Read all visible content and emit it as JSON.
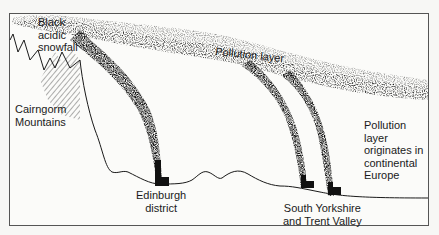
{
  "diagram": {
    "type": "illustrated cross-section",
    "colors": {
      "background": "#fbfbf9",
      "ink": "#1a1a1a",
      "frame": "#555555"
    },
    "labels": {
      "snowfall": [
        "Black",
        "acidic",
        "snowfall"
      ],
      "mountains": [
        "Cairngorm",
        "Mountains"
      ],
      "pollution_layer": "Pollution layer",
      "origin": [
        "Pollution",
        "layer",
        "originates in",
        "continental",
        "Europe"
      ],
      "edinburgh": [
        "Edinburgh",
        "district"
      ],
      "south_yorkshire": [
        "South Yorkshire",
        "and Trent Valley"
      ]
    },
    "elements": [
      {
        "name": "cairngorm-mountains",
        "kind": "terrain"
      },
      {
        "name": "snowfall-hatching",
        "kind": "hatched area"
      },
      {
        "name": "pollution-layer",
        "kind": "stippled band"
      },
      {
        "name": "edinburgh-chimney",
        "kind": "factory with plume"
      },
      {
        "name": "south-yorkshire-chimney-1",
        "kind": "factory with plume"
      },
      {
        "name": "south-yorkshire-chimney-2",
        "kind": "factory with plume"
      }
    ]
  }
}
